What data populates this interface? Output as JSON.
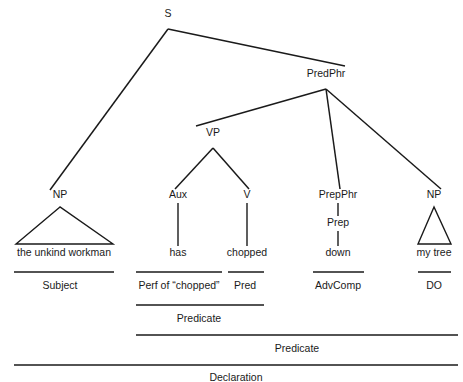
{
  "diagram": {
    "sentence": "the unkind workman has chopped down my tree",
    "ink_color": "#1a1a1a",
    "background_color": "#ffffff"
  },
  "nodes": {
    "s": {
      "label": "S",
      "x": 168,
      "y": 17
    },
    "predphr": {
      "label": "PredPhr",
      "x": 326,
      "y": 77
    },
    "vp": {
      "label": "VP",
      "x": 213,
      "y": 136
    },
    "np_subject": {
      "label": "NP",
      "x": 60,
      "y": 198
    },
    "aux": {
      "label": "Aux",
      "x": 178,
      "y": 198
    },
    "v": {
      "label": "V",
      "x": 247,
      "y": 198
    },
    "prepphr": {
      "label": "PrepPhr",
      "x": 338,
      "y": 198
    },
    "np_object": {
      "label": "NP",
      "x": 434,
      "y": 198
    },
    "prep": {
      "label": "Prep",
      "x": 338,
      "y": 226
    }
  },
  "terminals": {
    "subject_words": {
      "text": "the unkind workman",
      "x": 64,
      "y": 256
    },
    "aux_word": {
      "text": "has",
      "x": 178,
      "y": 256
    },
    "v_word": {
      "text": "chopped",
      "x": 247,
      "y": 256
    },
    "prep_word": {
      "text": "down",
      "x": 338,
      "y": 256
    },
    "object_words": {
      "text": "my tree",
      "x": 434,
      "y": 256
    }
  },
  "functions": {
    "row1": [
      {
        "label": "Subject",
        "x": 60,
        "y": 289,
        "rule_x1": 14,
        "rule_x2": 114,
        "rule_y": 272
      },
      {
        "label": "Perf of “chopped”",
        "x": 179,
        "y": 289,
        "rule_x1": 136,
        "rule_x2": 222,
        "rule_y": 272
      },
      {
        "label": "Pred",
        "x": 245,
        "y": 289,
        "rule_x1": 228,
        "rule_x2": 264,
        "rule_y": 272
      },
      {
        "label": "AdvComp",
        "x": 338,
        "y": 289,
        "rule_x1": 313,
        "rule_x2": 364,
        "rule_y": 272
      },
      {
        "label": "DO",
        "x": 434,
        "y": 289,
        "rule_x1": 418,
        "rule_x2": 451,
        "rule_y": 272
      }
    ],
    "row2": [
      {
        "label": "Predicate",
        "x": 199,
        "y": 322,
        "rule_x1": 136,
        "rule_x2": 264,
        "rule_y": 305
      }
    ],
    "row3": [
      {
        "label": "Predicate",
        "x": 297,
        "y": 352,
        "rule_x1": 136,
        "rule_x2": 458,
        "rule_y": 335
      }
    ],
    "row4": [
      {
        "label": "Declaration",
        "x": 236,
        "y": 381,
        "rule_x1": 14,
        "rule_x2": 458,
        "rule_y": 365
      }
    ]
  },
  "branches": {
    "s_apex": {
      "x": 168,
      "y": 29
    },
    "s_to_np": {
      "x1": 168,
      "y1": 29,
      "x2": 50,
      "y2": 190
    },
    "s_to_predphr": {
      "x1": 168,
      "y1": 29,
      "x2": 345,
      "y2": 66
    },
    "predphr_apex": {
      "x": 326,
      "y": 89
    },
    "predphr_to_vp": {
      "x1": 326,
      "y1": 89,
      "x2": 196,
      "y2": 126
    },
    "predphr_to_prepphr": {
      "x1": 326,
      "y1": 89,
      "x2": 340,
      "y2": 189
    },
    "predphr_to_np": {
      "x1": 326,
      "y1": 89,
      "x2": 441,
      "y2": 189
    },
    "vp_apex": {
      "x": 213,
      "y": 148
    },
    "vp_to_aux": {
      "x1": 213,
      "y1": 148,
      "x2": 175,
      "y2": 189
    },
    "vp_to_v": {
      "x1": 213,
      "y1": 148,
      "x2": 249,
      "y2": 189
    },
    "aux_stem": {
      "x": 178,
      "y1": 203,
      "y2": 246
    },
    "v_stem": {
      "x": 247,
      "y1": 203,
      "y2": 246
    },
    "prepphr_stem": {
      "x": 338,
      "y1": 203,
      "y2": 216
    },
    "prep_stem": {
      "x": 338,
      "y1": 231,
      "y2": 246
    }
  },
  "triangles": {
    "subject_triangle": {
      "apex_x": 60,
      "apex_y": 207,
      "base_left_x": 16,
      "base_right_x": 113,
      "base_y": 244
    },
    "object_triangle": {
      "apex_x": 434,
      "apex_y": 207,
      "base_left_x": 418,
      "base_right_x": 451,
      "base_y": 244
    }
  }
}
